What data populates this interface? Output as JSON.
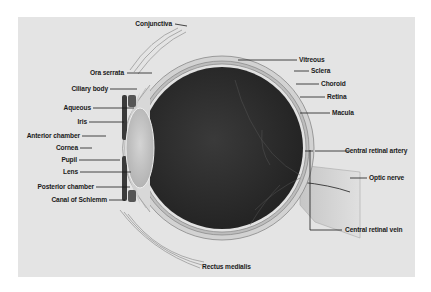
{
  "diagram": {
    "colors": {
      "background": "#e4e4e4",
      "vitreous": "#2e2e2e",
      "sclera": "#d2d2d2",
      "lens": "#c4c4c4",
      "leader_line": "#1a1a1a",
      "text": "#1a1a1a"
    },
    "labels_left": [
      {
        "id": "conjunctiva",
        "text": "Conjunctiva"
      },
      {
        "id": "ora-serrata",
        "text": "Ora serrata"
      },
      {
        "id": "ciliary-body",
        "text": "Ciliary body"
      },
      {
        "id": "aqueous",
        "text": "Aqueous"
      },
      {
        "id": "iris",
        "text": "Iris"
      },
      {
        "id": "anterior-chamber",
        "text": "Anterior chamber"
      },
      {
        "id": "cornea",
        "text": "Cornea"
      },
      {
        "id": "pupil",
        "text": "Pupil"
      },
      {
        "id": "lens",
        "text": "Lens"
      },
      {
        "id": "posterior-chamber",
        "text": "Posterior chamber"
      },
      {
        "id": "canal-of-schlemm",
        "text": "Canal of Schlemm"
      }
    ],
    "labels_right": [
      {
        "id": "vitreous",
        "text": "Vitreous"
      },
      {
        "id": "sclera",
        "text": "Sclera"
      },
      {
        "id": "choroid",
        "text": "Choroid"
      },
      {
        "id": "retina",
        "text": "Retina"
      },
      {
        "id": "macula",
        "text": "Macula"
      },
      {
        "id": "central-retinal-artery",
        "text": "Central retinal artery"
      },
      {
        "id": "optic-nerve",
        "text": "Optic nerve"
      },
      {
        "id": "central-retinal-vein",
        "text": "Central retinal vein"
      }
    ],
    "labels_bottom": [
      {
        "id": "rectus-medialis",
        "text": "Rectus medialis"
      }
    ]
  }
}
